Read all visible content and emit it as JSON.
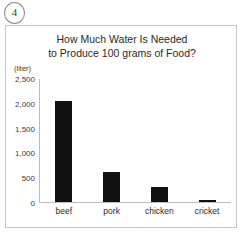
{
  "marker": {
    "label": "4"
  },
  "chart_data": {
    "type": "bar",
    "title": "How Much Water Is Needed to Produce 100 grams of Food?",
    "title_lines": [
      "How Much Water Is Needed",
      "to Produce 100 grams of Food?"
    ],
    "unit_label": "(liter)",
    "xlabel": "",
    "ylabel": "",
    "categories": [
      "beef",
      "pork",
      "chicken",
      "cricket"
    ],
    "values": [
      2060,
      600,
      300,
      50
    ],
    "ylim": [
      0,
      2500
    ],
    "ytick_values": [
      2500,
      2000,
      1500,
      1000,
      500,
      0
    ],
    "ytick_labels": [
      "2,500",
      "2,000",
      "1,500",
      "1,000",
      "500",
      "0"
    ],
    "grid": false,
    "legend": false,
    "bar_color": "#111111",
    "axis_color": "#bdbdbd"
  }
}
